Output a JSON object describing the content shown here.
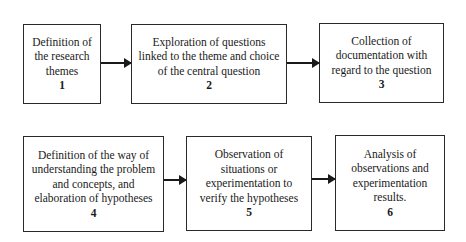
{
  "diagram": {
    "type": "flowchart",
    "steps": [
      {
        "number": "1",
        "text": "Definition of\nthe research\nthemes"
      },
      {
        "number": "2",
        "text": "Exploration of questions\nlinked to the theme and choice\nof the central question"
      },
      {
        "number": "3",
        "text": "Collection of\ndocumentation with\nregard to the question"
      },
      {
        "number": "4",
        "text": "Definition of the way of\nunderstanding the problem\nand concepts, and\nelaboration of hypotheses"
      },
      {
        "number": "5",
        "text": "Observation of\nsituations or\nexperimentation to\nverify the hypotheses"
      },
      {
        "number": "6",
        "text": "Analysis of\nobservations and\nexperimentation\nresults."
      }
    ],
    "edges": [
      {
        "from": "1",
        "to": "2"
      },
      {
        "from": "2",
        "to": "3"
      },
      {
        "from": "4",
        "to": "5"
      },
      {
        "from": "5",
        "to": "6"
      }
    ]
  }
}
